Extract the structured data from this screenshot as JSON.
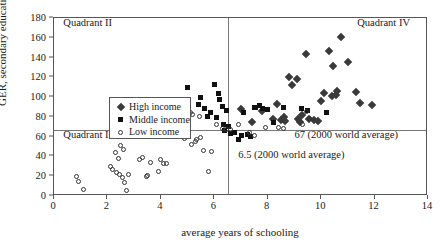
{
  "chart_data": {
    "type": "scatter",
    "title": "",
    "xlabel": "average years of schooling",
    "ylabel": "GER, secondary education",
    "xlim": [
      0,
      14
    ],
    "ylim": [
      0,
      180
    ],
    "xticks": [
      0,
      2,
      4,
      6,
      8,
      10,
      12,
      14
    ],
    "yticks": [
      0,
      20,
      40,
      60,
      80,
      100,
      120,
      140,
      160,
      180
    ],
    "grid": false,
    "legend_position": "upper-left-inside",
    "legend": [
      {
        "label": "High income",
        "marker": "diamond-filled",
        "key": "high"
      },
      {
        "label": "Middle income",
        "marker": "square-filled",
        "key": "middle"
      },
      {
        "label": "Low income",
        "marker": "circle-open",
        "key": "low"
      }
    ],
    "reference_lines": [
      {
        "axis": "x",
        "value": 6.5,
        "label": "6.5 (2000 world average)"
      },
      {
        "axis": "y",
        "value": 67,
        "label": "67 (2000 world average)"
      }
    ],
    "annotations": [
      {
        "text": "Quadrant II",
        "x": 0.35,
        "y": 174
      },
      {
        "text": "Quadrant IV",
        "x": 11.35,
        "y": 174
      },
      {
        "text": "Quadrant I",
        "x": 0.35,
        "y": 61
      },
      {
        "text": "67 (2000 world average)",
        "x": 9.0,
        "y": 61
      },
      {
        "text": "6.5 (2000 world average)",
        "x": 6.9,
        "y": 40
      }
    ],
    "series": [
      {
        "name": "High income",
        "key": "high",
        "points": [
          [
            7.0,
            88
          ],
          [
            7.4,
            75
          ],
          [
            7.8,
            86
          ],
          [
            8.2,
            78
          ],
          [
            8.35,
            93
          ],
          [
            8.5,
            77
          ],
          [
            8.6,
            80
          ],
          [
            8.65,
            76
          ],
          [
            8.8,
            120
          ],
          [
            8.9,
            112
          ],
          [
            9.1,
            118
          ],
          [
            9.15,
            78
          ],
          [
            9.2,
            75
          ],
          [
            9.3,
            82
          ],
          [
            9.45,
            144
          ],
          [
            9.55,
            78
          ],
          [
            9.75,
            77
          ],
          [
            9.9,
            76
          ],
          [
            10.0,
            96
          ],
          [
            10.1,
            104
          ],
          [
            10.3,
            147
          ],
          [
            10.4,
            101
          ],
          [
            10.45,
            131
          ],
          [
            10.55,
            102
          ],
          [
            10.6,
            106
          ],
          [
            10.75,
            161
          ],
          [
            11.0,
            136
          ],
          [
            11.3,
            105
          ],
          [
            11.45,
            94
          ],
          [
            11.9,
            92
          ]
        ]
      },
      {
        "name": "Middle income",
        "key": "middle",
        "points": [
          [
            5.0,
            110
          ],
          [
            5.4,
            93
          ],
          [
            5.5,
            100
          ],
          [
            5.65,
            88
          ],
          [
            5.75,
            80
          ],
          [
            5.85,
            84
          ],
          [
            6.0,
            113
          ],
          [
            6.1,
            79
          ],
          [
            6.15,
            104
          ],
          [
            6.2,
            98
          ],
          [
            6.3,
            91
          ],
          [
            6.35,
            72
          ],
          [
            6.4,
            66
          ],
          [
            6.45,
            86
          ],
          [
            6.55,
            70
          ],
          [
            6.6,
            63
          ],
          [
            6.75,
            64
          ],
          [
            6.9,
            57
          ],
          [
            7.0,
            61
          ],
          [
            7.1,
            84
          ],
          [
            7.25,
            62
          ],
          [
            7.35,
            60
          ],
          [
            7.5,
            90
          ],
          [
            7.55,
            89
          ],
          [
            7.7,
            92
          ],
          [
            7.8,
            88
          ],
          [
            8.0,
            87
          ],
          [
            8.2,
            74
          ],
          [
            8.6,
            90
          ],
          [
            9.25,
            88
          ],
          [
            9.5,
            86
          ],
          [
            10.2,
            84
          ]
        ]
      },
      {
        "name": "Low income",
        "key": "low",
        "points": [
          [
            0.85,
            20
          ],
          [
            0.9,
            15
          ],
          [
            1.1,
            7
          ],
          [
            2.1,
            30
          ],
          [
            2.2,
            27
          ],
          [
            2.3,
            44
          ],
          [
            2.35,
            24
          ],
          [
            2.4,
            38
          ],
          [
            2.45,
            22
          ],
          [
            2.5,
            51
          ],
          [
            2.55,
            19
          ],
          [
            2.6,
            47
          ],
          [
            2.65,
            14
          ],
          [
            2.7,
            6
          ],
          [
            2.8,
            22
          ],
          [
            3.2,
            37
          ],
          [
            3.3,
            39
          ],
          [
            3.45,
            20
          ],
          [
            3.5,
            21
          ],
          [
            3.6,
            34
          ],
          [
            3.9,
            25
          ],
          [
            4.0,
            37
          ],
          [
            4.1,
            33
          ],
          [
            4.2,
            33
          ],
          [
            4.9,
            58
          ],
          [
            5.0,
            79
          ],
          [
            5.05,
            60
          ],
          [
            5.1,
            84
          ],
          [
            5.15,
            52
          ],
          [
            5.2,
            82
          ],
          [
            5.3,
            55
          ],
          [
            5.35,
            57
          ],
          [
            5.45,
            80
          ],
          [
            5.5,
            59
          ],
          [
            5.6,
            46
          ],
          [
            5.8,
            25
          ],
          [
            5.9,
            45
          ],
          [
            6.1,
            72
          ],
          [
            6.3,
            68
          ],
          [
            6.45,
            67
          ],
          [
            6.6,
            67
          ],
          [
            6.9,
            72
          ],
          [
            7.3,
            64
          ],
          [
            7.5,
            61
          ],
          [
            7.9,
            69
          ],
          [
            8.4,
            69
          ],
          [
            8.6,
            68
          ],
          [
            9.3,
            72
          ],
          [
            9.45,
            85
          ],
          [
            9.55,
            78
          ]
        ]
      }
    ]
  }
}
